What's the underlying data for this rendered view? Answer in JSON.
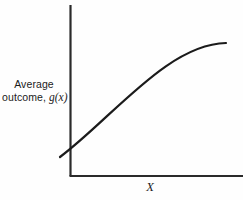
{
  "figure": {
    "background_color": "#fefefe",
    "ink_color": "#1b1b1b",
    "axis_color": "#2a2a2a"
  },
  "labels": {
    "y_axis_line1": "Average",
    "y_axis_line2_prefix": "outcome,",
    "y_axis_line2_math": "g(x)",
    "x_axis": "X"
  },
  "chart_data": {
    "type": "line",
    "title": "",
    "subtitle": "",
    "xlabel": "X",
    "ylabel": "Average outcome, g(x)",
    "grid": false,
    "legend": null,
    "annotations": [],
    "axis_style": "two-sided L-shaped axes, no tick marks, no tick labels",
    "xlim": [
      0,
      100
    ],
    "ylim": [
      0,
      100
    ],
    "series": [
      {
        "name": "g(x)",
        "color": "#1b1b1b",
        "line_width": 2.2,
        "x": [
          0,
          5,
          12,
          20,
          30,
          40,
          50,
          60,
          70,
          80,
          90,
          100
        ],
        "y": [
          10,
          19,
          32,
          44,
          58,
          69,
          78,
          85,
          90,
          93,
          95,
          96
        ]
      }
    ],
    "curve_pixel_path": {
      "start": [
        60,
        157
      ],
      "control1": [
        112,
        118
      ],
      "control2": [
        168,
        44
      ],
      "end": [
        226,
        43
      ]
    },
    "axes_pixels": {
      "y_axis_x": 70,
      "y_axis_top": 5,
      "y_axis_bottom": 176,
      "x_axis_y": 176,
      "x_axis_left": 70,
      "x_axis_right": 243
    }
  }
}
